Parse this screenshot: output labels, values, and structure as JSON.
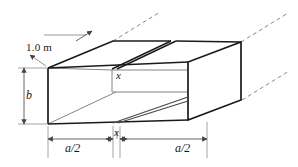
{
  "figure": {
    "colors": {
      "solid_line": "#1a1a1a",
      "thin_line": "#6b6b6b",
      "dimension_line": "#555555",
      "dashed_line": "#8a8a8a",
      "background": "#ffffff"
    },
    "labels": {
      "depth": "1.0 m",
      "height": "b",
      "slot_width_inner": "x",
      "slot_width_bottom": "x",
      "half_width_left": "a/2",
      "half_width_right": "a/2"
    },
    "icon_names": {
      "depth_arrow": "dimension-arrow-icon",
      "height_arrow": "dimension-arrow-icon",
      "width_arrow": "dimension-arrow-icon",
      "extension_line": "extension-line-icon",
      "dashed_extension": "dashed-extension-icon"
    }
  }
}
